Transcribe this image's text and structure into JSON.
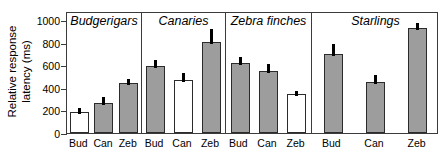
{
  "chart_data": {
    "type": "bar",
    "title": "",
    "xlabel": "",
    "ylabel": "Relative response\nlatency (ms)",
    "ylim": [
      0,
      1080
    ],
    "yticks": [
      0,
      200,
      400,
      600,
      800,
      1000
    ],
    "ytick_labels": [
      "0",
      "200",
      "400",
      "600",
      "800",
      "1000"
    ],
    "grid": false,
    "legend": "none",
    "categories": [
      "Bud",
      "Can",
      "Zeb"
    ],
    "panels": [
      {
        "name": "Budgerigars",
        "bars": [
          {
            "category": "Bud",
            "value": 190,
            "error": 35,
            "fill": "white"
          },
          {
            "category": "Can",
            "value": 270,
            "error": 45,
            "fill": "gray"
          },
          {
            "category": "Zeb",
            "value": 440,
            "error": 40,
            "fill": "gray"
          }
        ]
      },
      {
        "name": "Canaries",
        "bars": [
          {
            "category": "Bud",
            "value": 590,
            "error": 55,
            "fill": "gray"
          },
          {
            "category": "Can",
            "value": 465,
            "error": 70,
            "fill": "white"
          },
          {
            "category": "Zeb",
            "value": 805,
            "error": 115,
            "fill": "gray"
          }
        ]
      },
      {
        "name": "Zebra finches",
        "bars": [
          {
            "category": "Bud",
            "value": 620,
            "error": 55,
            "fill": "gray"
          },
          {
            "category": "Can",
            "value": 550,
            "error": 60,
            "fill": "gray"
          },
          {
            "category": "Zeb",
            "value": 345,
            "error": 30,
            "fill": "white"
          }
        ]
      },
      {
        "name": "Starlings",
        "bars": [
          {
            "category": "Bud",
            "value": 700,
            "error": 90,
            "fill": "gray"
          },
          {
            "category": "Can",
            "value": 455,
            "error": 60,
            "fill": "gray"
          },
          {
            "category": "Zeb",
            "value": 930,
            "error": 45,
            "fill": "gray"
          }
        ]
      }
    ]
  },
  "colors": {
    "bar_gray": "#9d9d9d",
    "bar_white": "#ffffff",
    "bar_edge": "#2b2b2b",
    "axis": "#3b3b3b",
    "error": "#000000",
    "text": "#000000",
    "background": "#ffffff"
  }
}
